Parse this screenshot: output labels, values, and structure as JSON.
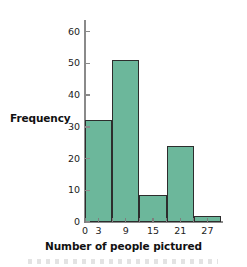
{
  "chart_data": {
    "type": "bar",
    "title": "",
    "subtitle": "",
    "xlabel": "Number of people pictured",
    "ylabel": "Frequency",
    "grid": false,
    "legend": false,
    "bin_width": 6,
    "bin_edges": [
      0,
      6,
      12,
      18,
      24,
      30
    ],
    "categories": [
      "0-6",
      "6-12",
      "12-18",
      "18-24",
      "24-30"
    ],
    "values": [
      32,
      51,
      8.5,
      24,
      2
    ],
    "xlim": [
      0,
      30
    ],
    "ylim": [
      0,
      63
    ],
    "x_ticks": [
      0,
      3,
      6,
      9,
      12,
      15,
      18,
      21,
      24,
      27
    ],
    "x_tick_labels": [
      "0",
      "3",
      "",
      "9",
      "",
      "15",
      "",
      "21",
      "",
      "27"
    ],
    "y_ticks": [
      0,
      10,
      20,
      30,
      40,
      50,
      60
    ],
    "y_tick_labels": [
      "0",
      "10",
      "20",
      "30",
      "40",
      "50",
      "60"
    ],
    "bar_color": "#6CB79B",
    "bar_edge_color": "#2d2d2d",
    "axis_color": "#8a8a8a"
  },
  "axes": {
    "y_title": "Frequency",
    "x_title": "Number of people pictured"
  }
}
